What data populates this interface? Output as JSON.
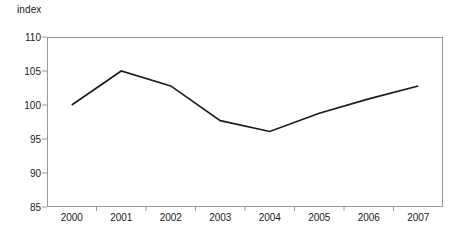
{
  "chart_data": {
    "type": "line",
    "title": "",
    "subtitle": "",
    "ylabel": "index",
    "xlabel": "",
    "categories": [
      "2000",
      "2001",
      "2002",
      "2003",
      "2004",
      "2005",
      "2006",
      "2007"
    ],
    "values": [
      100.0,
      105.0,
      102.8,
      97.7,
      96.1,
      98.8,
      100.9,
      102.8
    ],
    "series": [
      {
        "name": "index",
        "values": [
          100.0,
          105.0,
          102.8,
          97.7,
          96.1,
          98.8,
          100.9,
          102.8
        ]
      }
    ],
    "ylim": [
      85,
      110
    ],
    "yticks": [
      85,
      90,
      95,
      100,
      105,
      110
    ],
    "ytick_labels": [
      "85",
      "90",
      "95",
      "100",
      "105",
      "110"
    ],
    "grid": false,
    "legend": false,
    "legend_position": "none",
    "line_color": "#1a1a1a",
    "frame_color": "#9a9a9a",
    "background_color": "#ffffff",
    "markers": false,
    "annotations": []
  }
}
